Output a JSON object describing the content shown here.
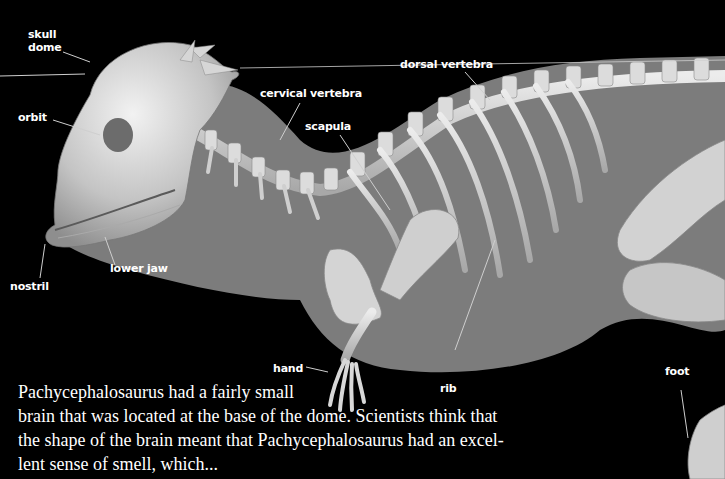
{
  "figure": {
    "colors": {
      "background": "#000000",
      "body_silhouette": "#7c7c7c",
      "bone": "#d4d4d4",
      "bone_shadow": "#9a9a9a",
      "label_text": "#ffffff",
      "leader_line": "#cfcfcf"
    }
  },
  "labels": {
    "skull_dome": [
      "skull",
      "dome"
    ],
    "orbit": "orbit",
    "nostril": "nostril",
    "lower_jaw": "lower jaw",
    "cervical_vertebra": "cervical vertebra",
    "scapula": "scapula",
    "dorsal_vertebra": "dorsal vertebra",
    "hand": "hand",
    "rib": "rib",
    "foot": "foot"
  },
  "caption": {
    "lines": [
      "Pachycephalosaurus had a fairly small",
      "brain that was located at the base of the dome. Scientists think that",
      "the shape of the brain meant that Pachycephalosaurus had an excel-",
      "lent sense of smell, which..."
    ]
  }
}
